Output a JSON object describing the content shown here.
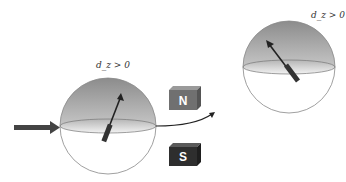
{
  "labels": {
    "left_sphere": "d_z > 0",
    "right_sphere": "d_z > 0",
    "magnet_north": "N",
    "magnet_south": "S"
  },
  "colors": {
    "sphere_outline": "#888888",
    "sphere_top_shade": "#9a9a9a",
    "arrow": "#333333",
    "magnet_north": "#6e6e6e",
    "magnet_south": "#2e2e2e"
  },
  "elements": {
    "incoming_beam": "incoming-arrow",
    "left_sphere": "bloch-sphere-before",
    "magnets": [
      "north-magnet",
      "south-magnet"
    ],
    "deflected_beam": "curved-trajectory",
    "right_sphere": "bloch-sphere-after"
  }
}
